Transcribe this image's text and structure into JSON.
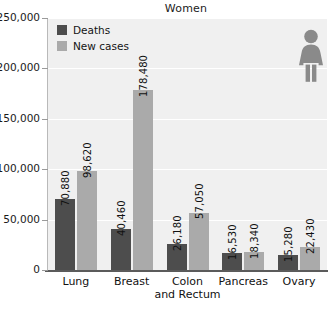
{
  "chart_data": {
    "type": "bar",
    "title": "Women",
    "xlabel": "",
    "ylabel": "",
    "ylim": [
      0,
      250000
    ],
    "grid": true,
    "legend_position": "top-left",
    "categories": [
      "Lung",
      "Breast",
      "Colon and Rectum",
      "Pancreas",
      "Ovary"
    ],
    "category_lines": [
      [
        "Lung"
      ],
      [
        "Breast"
      ],
      [
        "Colon",
        "and Rectum"
      ],
      [
        "Pancreas"
      ],
      [
        "Ovary"
      ]
    ],
    "series": [
      {
        "name": "Deaths",
        "color": "#4d4d4d",
        "values": [
          70880,
          40460,
          26180,
          16530,
          15280
        ],
        "labels": [
          "70,880",
          "40,460",
          "26,180",
          "16,530",
          "15,280"
        ]
      },
      {
        "name": "New cases",
        "color": "#aaaaaa",
        "values": [
          98620,
          178480,
          57050,
          18340,
          22430
        ],
        "labels": [
          "98,620",
          "178,480",
          "57,050",
          "18,340",
          "22,430"
        ]
      }
    ],
    "y_ticks": [
      0,
      50000,
      100000,
      150000,
      200000,
      250000
    ],
    "y_tick_labels": [
      "0",
      "50,000",
      "100,000",
      "150,000",
      "200,000",
      "250,000"
    ]
  },
  "legend": {
    "items": [
      {
        "label": "Deaths",
        "color": "#4d4d4d"
      },
      {
        "label": "New cases",
        "color": "#aaaaaa"
      }
    ]
  },
  "icons": {
    "figure": "woman-pictogram-icon",
    "figure_color": "#8a8a8a"
  },
  "colors": {
    "plot_background": "#f0f0f0",
    "gridline": "#ffffff",
    "axis_baseline": "#5b5b5b",
    "y_axis": "#b9b9b9",
    "text": "#111111"
  }
}
